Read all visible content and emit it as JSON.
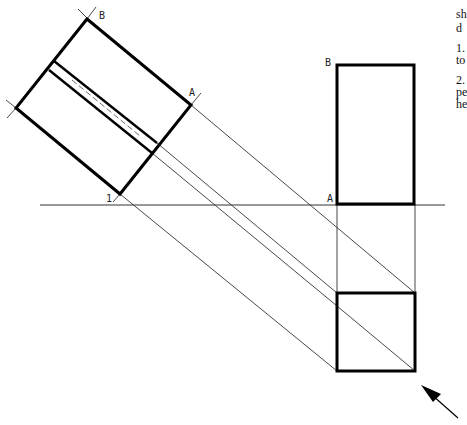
{
  "diagram": {
    "type": "auxiliary-view-projection",
    "colors": {
      "ink": "#111111",
      "background": "#ffffff"
    },
    "labels": {
      "rotated_view": {
        "corner_top": "B",
        "corner_right": "A",
        "corner_bottom": "1"
      },
      "front_view": {
        "top_left": "B",
        "bottom_left": "A"
      }
    },
    "arrow": {
      "name": "view-direction-arrow",
      "direction": "up-left"
    }
  },
  "side_text": {
    "lines": [
      "sh",
      "d",
      "1.",
      "to",
      "2.",
      "pe",
      "he"
    ]
  }
}
